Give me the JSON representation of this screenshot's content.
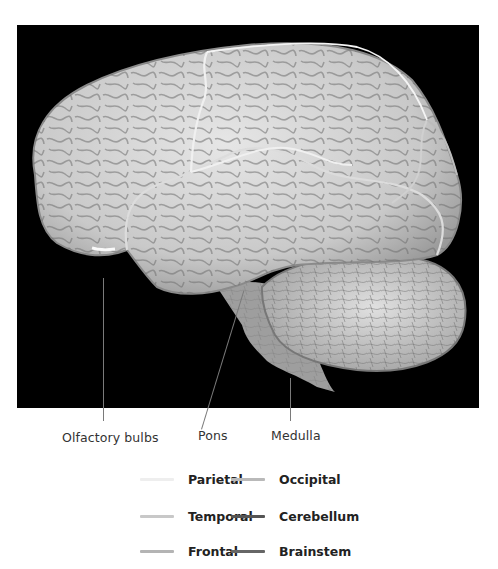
{
  "figure": {
    "background_color": "#000000"
  },
  "callouts": [
    {
      "label": "Olfactory bulbs"
    },
    {
      "label": "Pons"
    },
    {
      "label": "Medulla"
    }
  ],
  "legend": {
    "items": [
      {
        "label": "Parietal",
        "color": "#eeeeee"
      },
      {
        "label": "Temporal",
        "color": "#c8c8c8"
      },
      {
        "label": "Frontal",
        "color": "#b4b4b4"
      },
      {
        "label": "Occipital",
        "color": "#b9b9b9"
      },
      {
        "label": "Cerebellum",
        "color": "#555555"
      },
      {
        "label": "Brainstem",
        "color": "#666666"
      }
    ]
  }
}
